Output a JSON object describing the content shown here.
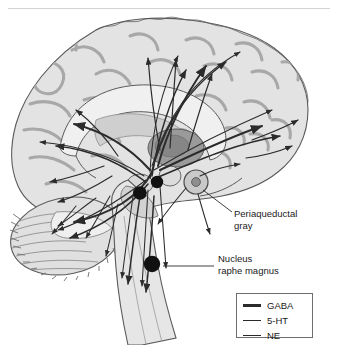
{
  "figure": {
    "title_rule": "",
    "annotations": [
      {
        "name": "periaqueductal-gray",
        "line1": "Periaqueductal",
        "line2": "gray"
      },
      {
        "name": "nucleus-raphe-magnus",
        "line1": "Nucleus",
        "line2": "raphe magnus"
      }
    ],
    "legend": {
      "items": [
        {
          "label": "GABA",
          "color": "#2b2b2b",
          "weight": "thick"
        },
        {
          "label": "5-HT",
          "color": "#2b2b2b",
          "weight": "medium"
        },
        {
          "label": "NE",
          "color": "#2b2b2b",
          "weight": "thin"
        }
      ]
    },
    "structures": [
      "cerebral-cortex",
      "corpus-callosum",
      "thalamus",
      "periaqueductal-gray",
      "cerebellum",
      "brainstem",
      "spinal-cord",
      "nucleus-raphe-magnus"
    ],
    "colors": {
      "background": "#ffffff",
      "rule": "#d3d3d3",
      "brain_fill": "#e3e3e3",
      "brain_mid": "#cccccc",
      "brain_dark": "#a8a8a8",
      "outline": "#5a5a5a",
      "pathway": "#2b2b2b",
      "legend_border": "#6e6e6e"
    }
  }
}
